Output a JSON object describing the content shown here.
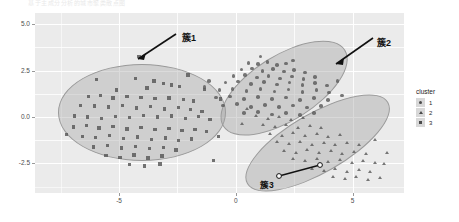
{
  "title_strip": "基于主成分分析的城市聚类散点图",
  "legend": {
    "title": "cluster",
    "items": [
      {
        "label": "1",
        "marker": "circle-marker-icon"
      },
      {
        "label": "2",
        "marker": "triangle-marker-icon"
      },
      {
        "label": "3",
        "marker": "square-marker-icon"
      }
    ]
  },
  "annotations": [
    {
      "text": "簇1",
      "x": 182,
      "y": 31
    },
    {
      "text": "簇2",
      "x": 377,
      "y": 36
    },
    {
      "text": "簇3",
      "x": 260,
      "y": 178
    }
  ],
  "chart_data": {
    "type": "scatter",
    "title": "",
    "xlabel": "",
    "ylabel": "",
    "xlim": [
      -8.6,
      7.2
    ],
    "ylim": [
      -4.1,
      5.6
    ],
    "xticks": [
      "-5",
      "0",
      "5"
    ],
    "xtick_values": [
      -5,
      0,
      5
    ],
    "yticks": [
      "-2.5",
      "0.0",
      "2.5",
      "5.0"
    ],
    "ytick_values": [
      -2.5,
      0.0,
      2.5,
      5.0
    ],
    "grid": true,
    "legend_position": "right",
    "legend_title": "cluster",
    "series": [
      {
        "name": "3",
        "marker": "square",
        "color": "#555555",
        "hull": {
          "cx": -4.05,
          "cy": 0.3,
          "rx": 3.55,
          "ry": 2.55,
          "rotate": 0
        },
        "points": [
          [
            -4.15,
            3.25
          ],
          [
            -4.3,
            2.05
          ],
          [
            -3.5,
            1.92
          ],
          [
            -3.1,
            1.8
          ],
          [
            -2.75,
            1.72
          ],
          [
            -2.4,
            1.62
          ],
          [
            -3.8,
            1.55
          ],
          [
            -5.1,
            1.45
          ],
          [
            -6.3,
            1.08
          ],
          [
            -5.8,
            1.15
          ],
          [
            -5.25,
            1.02
          ],
          [
            -4.65,
            1.1
          ],
          [
            -4.05,
            1.05
          ],
          [
            -3.45,
            0.98
          ],
          [
            -2.85,
            1.02
          ],
          [
            -2.25,
            0.92
          ],
          [
            -1.8,
            0.85
          ],
          [
            -6.65,
            0.62
          ],
          [
            -6.05,
            0.58
          ],
          [
            -5.45,
            0.52
          ],
          [
            -4.85,
            0.6
          ],
          [
            -4.25,
            0.48
          ],
          [
            -3.65,
            0.55
          ],
          [
            -3.05,
            0.42
          ],
          [
            -2.45,
            0.5
          ],
          [
            -1.95,
            0.38
          ],
          [
            -1.45,
            0.3
          ],
          [
            -6.9,
            0.05
          ],
          [
            -6.35,
            0.0
          ],
          [
            -5.75,
            -0.08
          ],
          [
            -5.15,
            0.02
          ],
          [
            -4.55,
            -0.05
          ],
          [
            -3.95,
            0.08
          ],
          [
            -3.35,
            -0.02
          ],
          [
            -2.75,
            0.05
          ],
          [
            -2.15,
            -0.1
          ],
          [
            -1.6,
            0.02
          ],
          [
            -1.1,
            -0.15
          ],
          [
            -6.95,
            -0.55
          ],
          [
            -6.4,
            -0.48
          ],
          [
            -5.85,
            -0.6
          ],
          [
            -5.25,
            -0.52
          ],
          [
            -4.65,
            -0.65
          ],
          [
            -4.05,
            -0.58
          ],
          [
            -3.45,
            -0.7
          ],
          [
            -2.85,
            -0.62
          ],
          [
            -2.3,
            -0.75
          ],
          [
            -1.75,
            -0.68
          ],
          [
            -1.25,
            -0.8
          ],
          [
            -6.55,
            -1.05
          ],
          [
            -6.0,
            -1.12
          ],
          [
            -5.4,
            -1.02
          ],
          [
            -4.8,
            -1.18
          ],
          [
            -4.2,
            -1.08
          ],
          [
            -3.6,
            -1.22
          ],
          [
            -3.0,
            -1.15
          ],
          [
            -2.45,
            -1.28
          ],
          [
            -1.9,
            -1.2
          ],
          [
            -6.1,
            -1.62
          ],
          [
            -5.5,
            -1.55
          ],
          [
            -4.9,
            -1.68
          ],
          [
            -4.3,
            -1.6
          ],
          [
            -3.7,
            -1.72
          ],
          [
            -3.1,
            -1.65
          ],
          [
            -2.55,
            -1.78
          ],
          [
            -5.55,
            -2.1
          ],
          [
            -4.95,
            -2.18
          ],
          [
            -4.35,
            -2.05
          ],
          [
            -3.75,
            -2.22
          ],
          [
            -3.15,
            -2.12
          ],
          [
            -4.55,
            -2.58
          ],
          [
            -3.9,
            -2.65
          ],
          [
            -3.25,
            -2.55
          ],
          [
            -0.95,
            -2.35
          ],
          [
            -0.65,
            0.95
          ],
          [
            -0.75,
            -1.05
          ],
          [
            -7.25,
            -0.95
          ],
          [
            -2.05,
            2.25
          ],
          [
            -1.35,
            1.48
          ],
          [
            -5.95,
            2.02
          ]
        ]
      },
      {
        "name": "1",
        "marker": "circle",
        "color": "#5a5a5a",
        "hull": {
          "cx": 2.05,
          "cy": 1.62,
          "rx": 3.05,
          "ry": 1.72,
          "rotate": -32
        },
        "points": [
          [
            0.55,
            2.92
          ],
          [
            0.95,
            2.85
          ],
          [
            1.35,
            2.95
          ],
          [
            1.75,
            2.8
          ],
          [
            2.15,
            2.88
          ],
          [
            0.25,
            2.55
          ],
          [
            0.7,
            2.6
          ],
          [
            1.15,
            2.48
          ],
          [
            1.6,
            2.58
          ],
          [
            2.05,
            2.45
          ],
          [
            2.5,
            2.52
          ],
          [
            2.95,
            2.4
          ],
          [
            -0.1,
            2.2
          ],
          [
            0.4,
            2.25
          ],
          [
            0.9,
            2.12
          ],
          [
            1.4,
            2.22
          ],
          [
            1.9,
            2.08
          ],
          [
            2.4,
            2.18
          ],
          [
            2.9,
            2.05
          ],
          [
            3.4,
            2.15
          ],
          [
            -0.45,
            1.85
          ],
          [
            0.1,
            1.9
          ],
          [
            0.65,
            1.78
          ],
          [
            1.2,
            1.88
          ],
          [
            1.75,
            1.75
          ],
          [
            2.3,
            1.85
          ],
          [
            2.85,
            1.72
          ],
          [
            3.4,
            1.82
          ],
          [
            3.9,
            1.7
          ],
          [
            -0.7,
            1.45
          ],
          [
            -0.15,
            1.5
          ],
          [
            0.45,
            1.4
          ],
          [
            1.05,
            1.52
          ],
          [
            1.65,
            1.38
          ],
          [
            2.25,
            1.48
          ],
          [
            2.85,
            1.35
          ],
          [
            3.45,
            1.45
          ],
          [
            4.0,
            1.32
          ],
          [
            -0.85,
            1.05
          ],
          [
            -0.25,
            1.1
          ],
          [
            0.35,
            0.98
          ],
          [
            0.95,
            1.08
          ],
          [
            1.55,
            0.95
          ],
          [
            2.15,
            1.05
          ],
          [
            2.75,
            0.92
          ],
          [
            3.35,
            1.02
          ],
          [
            3.95,
            0.9
          ],
          [
            -0.55,
            0.62
          ],
          [
            0.05,
            0.68
          ],
          [
            0.65,
            0.55
          ],
          [
            1.25,
            0.65
          ],
          [
            1.85,
            0.52
          ],
          [
            2.45,
            0.62
          ],
          [
            3.05,
            0.5
          ],
          [
            3.65,
            0.6
          ],
          [
            0.35,
            0.2
          ],
          [
            0.95,
            0.25
          ],
          [
            1.55,
            0.12
          ],
          [
            2.15,
            0.22
          ],
          [
            2.75,
            0.1
          ],
          [
            3.35,
            0.2
          ],
          [
            -1.15,
            1.95
          ],
          [
            -1.35,
            1.62
          ],
          [
            4.35,
            1.95
          ],
          [
            4.55,
            1.15
          ],
          [
            1.05,
            3.25
          ],
          [
            2.45,
            3.05
          ]
        ]
      },
      {
        "name": "2",
        "marker": "triangle",
        "color": "#5a5a5a",
        "hull": {
          "cx": 3.45,
          "cy": -1.35,
          "rx": 3.45,
          "ry": 1.55,
          "rotate": -30
        },
        "points": [
          [
            0.85,
            0.05
          ],
          [
            1.35,
            -0.1
          ],
          [
            1.85,
            0.02
          ],
          [
            2.35,
            -0.15
          ],
          [
            2.85,
            -0.05
          ],
          [
            1.15,
            -0.45
          ],
          [
            1.65,
            -0.55
          ],
          [
            2.15,
            -0.42
          ],
          [
            2.65,
            -0.58
          ],
          [
            3.15,
            -0.48
          ],
          [
            3.65,
            -0.6
          ],
          [
            1.45,
            -0.9
          ],
          [
            1.95,
            -1.0
          ],
          [
            2.45,
            -0.88
          ],
          [
            2.95,
            -1.02
          ],
          [
            3.45,
            -0.92
          ],
          [
            3.95,
            -1.05
          ],
          [
            4.45,
            -0.95
          ],
          [
            1.75,
            -1.35
          ],
          [
            2.25,
            -1.45
          ],
          [
            2.75,
            -1.32
          ],
          [
            3.25,
            -1.48
          ],
          [
            3.75,
            -1.38
          ],
          [
            4.25,
            -1.5
          ],
          [
            4.75,
            -1.4
          ],
          [
            5.25,
            -1.52
          ],
          [
            2.05,
            -1.82
          ],
          [
            2.55,
            -1.92
          ],
          [
            3.05,
            -1.78
          ],
          [
            3.55,
            -1.95
          ],
          [
            4.05,
            -1.85
          ],
          [
            4.55,
            -1.98
          ],
          [
            5.05,
            -1.88
          ],
          [
            5.55,
            -2.0
          ],
          [
            2.45,
            -2.28
          ],
          [
            2.95,
            -2.38
          ],
          [
            3.45,
            -2.25
          ],
          [
            3.95,
            -2.42
          ],
          [
            4.45,
            -2.32
          ],
          [
            4.95,
            -2.45
          ],
          [
            5.45,
            -2.35
          ],
          [
            5.95,
            -2.48
          ],
          [
            3.25,
            -2.8
          ],
          [
            3.75,
            -2.9
          ],
          [
            4.25,
            -2.78
          ],
          [
            4.75,
            -2.95
          ],
          [
            5.25,
            -2.85
          ],
          [
            5.75,
            -2.98
          ],
          [
            4.15,
            -3.25
          ],
          [
            4.65,
            -3.35
          ],
          [
            5.15,
            -3.22
          ],
          [
            5.65,
            -3.4
          ],
          [
            6.15,
            -3.28
          ],
          [
            0.45,
            0.45
          ],
          [
            6.35,
            -2.55
          ],
          [
            6.45,
            -1.95
          ],
          [
            5.95,
            -1.25
          ],
          [
            0.25,
            -0.35
          ]
        ]
      }
    ]
  }
}
